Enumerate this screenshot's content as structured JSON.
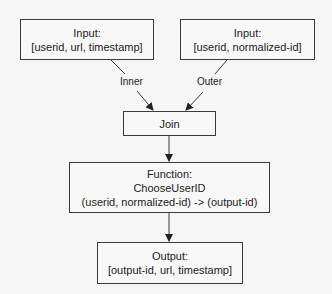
{
  "diagram": {
    "nodes": {
      "input_left": {
        "line1": "Input:",
        "line2": "[userid, url, timestamp]"
      },
      "input_right": {
        "line1": "Input:",
        "line2": "[userid, normalized-id]"
      },
      "join": {
        "line1": "Join"
      },
      "function": {
        "line1": "Function:",
        "line2": "ChooseUserID",
        "line3": "(userid, normalized-id) -> (output-id)"
      },
      "output": {
        "line1": "Output:",
        "line2": "[output-id, url, timestamp]"
      }
    },
    "edges": {
      "inner_label": "Inner",
      "outer_label": "Outer"
    },
    "colors": {
      "background": "#f6f6f6",
      "stroke": "#3a3a3a",
      "text": "#222222"
    }
  }
}
